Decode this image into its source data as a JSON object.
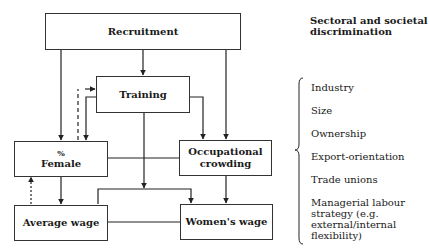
{
  "diagram": {
    "nodes": {
      "recruitment": "Recruitment",
      "training": "Training",
      "female_pct": "%",
      "female_label": "Female",
      "occupational_line1": "Occupational",
      "occupational_line2": "crowding",
      "average_wage": "Average wage",
      "womens_wage": "Women's wage"
    },
    "edges": [
      {
        "from": "Recruitment",
        "to": "Training",
        "style": "solid"
      },
      {
        "from": "Recruitment",
        "to": "% Female",
        "style": "solid"
      },
      {
        "from": "Recruitment",
        "to": "Occupational crowding",
        "style": "solid"
      },
      {
        "from": "Training",
        "to": "% Female",
        "style": "solid"
      },
      {
        "from": "Training",
        "to": "Occupational crowding",
        "style": "solid"
      },
      {
        "from": "Training",
        "to": "Average wage",
        "style": "solid"
      },
      {
        "from": "Training",
        "to": "Women's wage",
        "style": "solid"
      },
      {
        "from": "% Female",
        "to": "Training",
        "style": "dashed"
      },
      {
        "from": "% Female",
        "to": "Average wage",
        "style": "solid"
      },
      {
        "from": "% Female",
        "to": "Occupational crowding",
        "style": "line"
      },
      {
        "from": "Average wage",
        "to": "% Female",
        "style": "dotted"
      },
      {
        "from": "Occupational crowding",
        "to": "Women's wage",
        "style": "solid"
      },
      {
        "from": "Average wage",
        "to": "Women's wage",
        "style": "line"
      }
    ]
  },
  "sidebar": {
    "heading": "Sectoral and societal discrimination",
    "factors": [
      "Industry",
      "Size",
      "Ownership",
      "Export-orientation",
      "Trade unions",
      "Managerial labour strategy (e.g. external/internal flexibility)"
    ]
  }
}
